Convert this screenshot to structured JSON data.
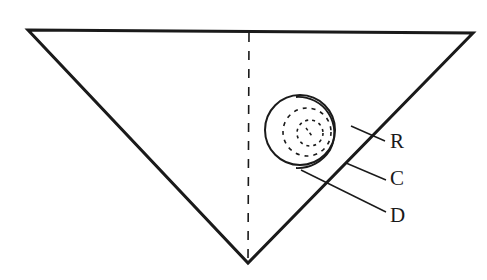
{
  "diagram": {
    "type": "geometric-figure",
    "labels": {
      "r": "R",
      "c": "C",
      "d": "D"
    },
    "colors": {
      "stroke": "#1a1a1a",
      "background": "#ffffff"
    }
  }
}
